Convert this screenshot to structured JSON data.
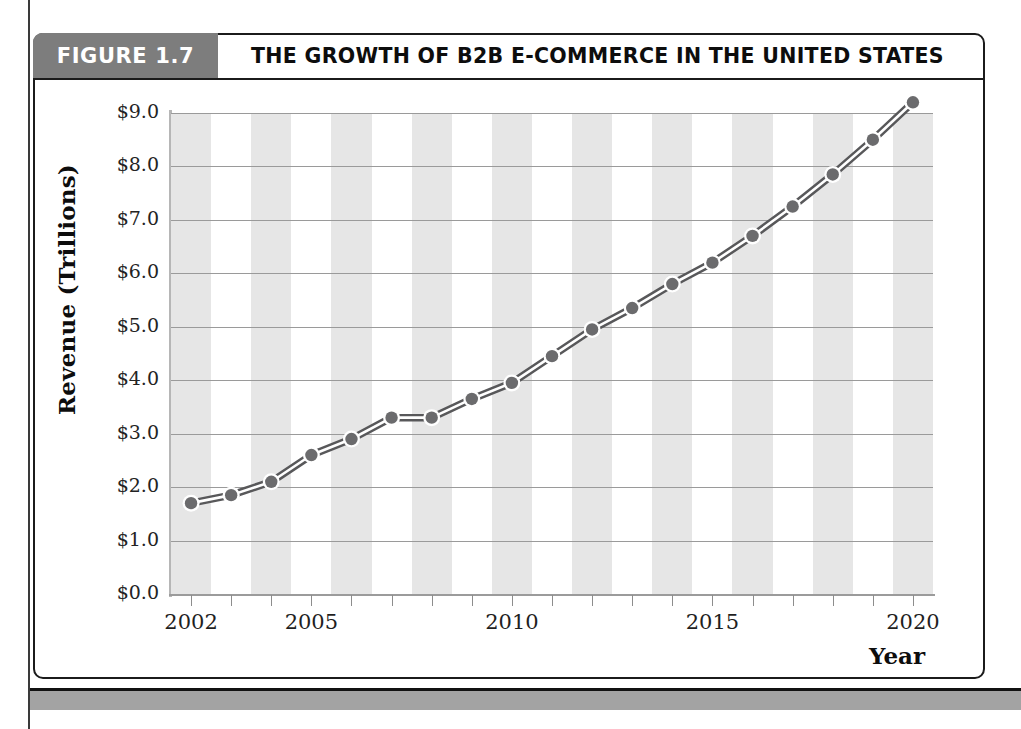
{
  "figure": {
    "tag_label": "FIGURE 1.7",
    "title": "THE GROWTH OF B2B E-COMMERCE IN THE UNITED STATES"
  },
  "colors": {
    "tag_background": "#7d7d7d",
    "line": "#58585a",
    "marker": "#6b6b6d",
    "band": "#e6e6e6",
    "gridline": "#9a9a9a",
    "footer_bar": "#a3a3a3",
    "frame_border": "#1b1b1b"
  },
  "chart_data": {
    "type": "line",
    "title": "THE GROWTH OF B2B E-COMMERCE IN THE UNITED STATES",
    "xlabel": "Year",
    "ylabel": "Revenue (Trillions)",
    "xlim": [
      2001.5,
      2020.5
    ],
    "ylim": [
      0.0,
      9.0
    ],
    "grid": true,
    "legend": "none",
    "x": [
      2002,
      2003,
      2004,
      2005,
      2006,
      2007,
      2008,
      2009,
      2010,
      2011,
      2012,
      2013,
      2014,
      2015,
      2016,
      2017,
      2018,
      2019,
      2020
    ],
    "values": [
      1.7,
      1.85,
      2.1,
      2.6,
      2.9,
      3.3,
      3.3,
      3.65,
      3.95,
      4.45,
      4.95,
      5.35,
      5.8,
      6.2,
      6.7,
      7.25,
      7.85,
      8.5,
      9.2
    ],
    "ytick_labels": [
      "$0.0",
      "$1.0",
      "$2.0",
      "$3.0",
      "$4.0",
      "$5.0",
      "$6.0",
      "$7.0",
      "$8.0",
      "$9.0"
    ],
    "ytick_values": [
      0,
      1,
      2,
      3,
      4,
      5,
      6,
      7,
      8,
      9
    ],
    "xtick_labels": [
      "2002",
      "2005",
      "2010",
      "2015",
      "2020"
    ],
    "xtick_values": [
      2002,
      2005,
      2010,
      2015,
      2020
    ]
  }
}
